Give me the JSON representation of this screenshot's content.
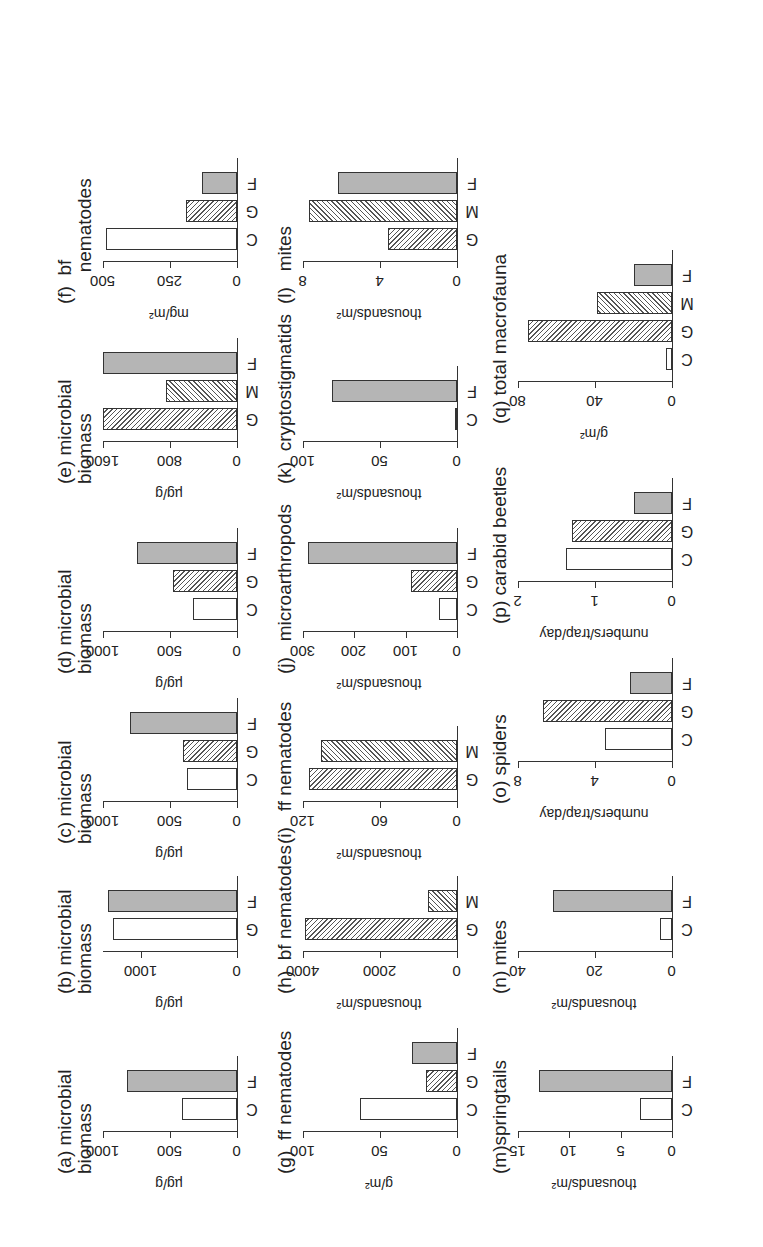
{
  "figure": {
    "orientation": "rotated 90 degrees counter-clockwise",
    "category_legend": {
      "C": "open",
      "G": "hatch-right",
      "M": "hatch-left",
      "F": "solid-grey"
    }
  },
  "chart_data": [
    {
      "id": "a",
      "type": "bar",
      "title": "(a) microbial\nbiomass",
      "ylabel": "µg/g",
      "ylim": [
        0,
        1000
      ],
      "yticks": [
        0,
        500,
        1000
      ],
      "categories": [
        "C",
        "F"
      ],
      "values": [
        410,
        820
      ],
      "styles": [
        "open",
        "solid"
      ]
    },
    {
      "id": "b",
      "type": "bar",
      "title": "(b) microbial\nbiomass",
      "ylabel": "µg/g",
      "ylim": [
        0,
        1400
      ],
      "yticks": [
        0,
        1000
      ],
      "categories": [
        "G",
        "F"
      ],
      "values": [
        1300,
        1350
      ],
      "styles": [
        "open",
        "solid"
      ]
    },
    {
      "id": "c",
      "type": "bar",
      "title": "(c) microbial\nbiomass",
      "ylabel": "µg/g",
      "ylim": [
        0,
        1000
      ],
      "yticks": [
        0,
        500,
        1000
      ],
      "categories": [
        "C",
        "G",
        "F"
      ],
      "values": [
        370,
        400,
        800
      ],
      "styles": [
        "open",
        "hatchG",
        "solid"
      ]
    },
    {
      "id": "d",
      "type": "bar",
      "title": "(d) microbial\nbiomass",
      "ylabel": "µg/g",
      "ylim": [
        0,
        1000
      ],
      "yticks": [
        0,
        500,
        1000
      ],
      "categories": [
        "C",
        "G",
        "F"
      ],
      "values": [
        330,
        480,
        750
      ],
      "styles": [
        "open",
        "hatchG",
        "solid"
      ]
    },
    {
      "id": "e",
      "type": "bar",
      "title": "(e) microbial\nbiomass",
      "ylabel": "µg/g",
      "ylim": [
        0,
        1600
      ],
      "yticks": [
        0,
        800,
        1600
      ],
      "categories": [
        "G",
        "M",
        "F"
      ],
      "values": [
        1600,
        850,
        1600
      ],
      "styles": [
        "hatchG",
        "hatchM",
        "solid"
      ]
    },
    {
      "id": "f",
      "type": "bar",
      "title": "(f)  bf\n      nematodes",
      "ylabel": "mg/m²",
      "ylim": [
        0,
        500
      ],
      "yticks": [
        0,
        250,
        500
      ],
      "categories": [
        "C",
        "G",
        "F"
      ],
      "values": [
        490,
        190,
        130
      ],
      "styles": [
        "open",
        "hatchG",
        "solid"
      ]
    },
    {
      "id": "g",
      "type": "bar",
      "title": "(g)  ff nematodes",
      "ylabel": "g/m²",
      "ylim": [
        0,
        100
      ],
      "yticks": [
        0,
        50,
        100
      ],
      "categories": [
        "C",
        "G",
        "F"
      ],
      "values": [
        63,
        20,
        29
      ],
      "styles": [
        "open",
        "hatchG",
        "solid"
      ]
    },
    {
      "id": "h",
      "type": "bar",
      "title": "(h)  bf nematodes",
      "ylabel": "thousands/m²",
      "ylim": [
        0,
        4000
      ],
      "yticks": [
        0,
        2000,
        4000
      ],
      "categories": [
        "G",
        "M"
      ],
      "values": [
        3950,
        750
      ],
      "styles": [
        "hatchG",
        "hatchM"
      ]
    },
    {
      "id": "i",
      "type": "bar",
      "title": "(i)   ff nematodes",
      "ylabel": "thousands/m²",
      "ylim": [
        0,
        120
      ],
      "yticks": [
        0,
        60,
        120
      ],
      "categories": [
        "G",
        "M"
      ],
      "values": [
        115,
        106
      ],
      "styles": [
        "hatchG",
        "hatchM"
      ]
    },
    {
      "id": "j",
      "type": "bar",
      "title": "(j)   microarthropods",
      "ylabel": "thousands/m²",
      "ylim": [
        0,
        300
      ],
      "yticks": [
        0,
        100,
        200,
        300
      ],
      "categories": [
        "C",
        "G",
        "F"
      ],
      "values": [
        35,
        90,
        290
      ],
      "styles": [
        "open",
        "hatchG",
        "solid"
      ]
    },
    {
      "id": "k",
      "type": "bar",
      "title": "(k)  cryptostigmatids",
      "ylabel": "thousands/m²",
      "ylim": [
        0,
        100
      ],
      "yticks": [
        0,
        50,
        100
      ],
      "categories": [
        "C",
        "F"
      ],
      "values": [
        1,
        81
      ],
      "styles": [
        "open",
        "solid"
      ]
    },
    {
      "id": "l",
      "type": "bar",
      "title": "(l)   mites",
      "ylabel": "thousands/m²",
      "ylim": [
        0,
        8
      ],
      "yticks": [
        0,
        4,
        8
      ],
      "categories": [
        "G",
        "M",
        "F"
      ],
      "values": [
        3.6,
        7.7,
        6.2
      ],
      "styles": [
        "hatchG",
        "hatchM",
        "solid"
      ]
    },
    {
      "id": "m",
      "type": "bar",
      "title": "(m)springtails",
      "ylabel": "thousands/m²",
      "ylim": [
        0,
        15
      ],
      "yticks": [
        0,
        5,
        10,
        15
      ],
      "categories": [
        "C",
        "F"
      ],
      "values": [
        3.1,
        13
      ],
      "styles": [
        "open",
        "solid"
      ]
    },
    {
      "id": "n",
      "type": "bar",
      "title": "(n) mites",
      "ylabel": "thousands/m²",
      "ylim": [
        0,
        40
      ],
      "yticks": [
        0,
        20,
        40
      ],
      "categories": [
        "C",
        "F"
      ],
      "values": [
        3.2,
        31
      ],
      "styles": [
        "open",
        "solid"
      ]
    },
    {
      "id": "o",
      "type": "bar",
      "title": "(o) spiders",
      "ylabel": "numbers/trap/day",
      "ylim": [
        0,
        8
      ],
      "yticks": [
        0,
        4,
        8
      ],
      "categories": [
        "C",
        "G",
        "F"
      ],
      "values": [
        3.5,
        6.7,
        2.2
      ],
      "styles": [
        "open",
        "hatchG",
        "solid"
      ]
    },
    {
      "id": "p",
      "type": "bar",
      "title": "(p) carabid beetles",
      "ylabel": "numbers/trap/day",
      "ylim": [
        0,
        2
      ],
      "yticks": [
        0,
        1,
        2
      ],
      "categories": [
        "C",
        "G",
        "F"
      ],
      "values": [
        1.38,
        1.3,
        0.5
      ],
      "styles": [
        "open",
        "hatchG",
        "solid"
      ]
    },
    {
      "id": "q",
      "type": "bar",
      "title": "(q) total macrofauna",
      "ylabel": "g/m²",
      "ylim": [
        0,
        80
      ],
      "yticks": [
        0,
        40,
        80
      ],
      "categories": [
        "C",
        "G",
        "M",
        "F"
      ],
      "values": [
        3,
        75,
        39,
        20
      ],
      "styles": [
        "open",
        "hatchG",
        "hatchM",
        "solid"
      ]
    }
  ]
}
